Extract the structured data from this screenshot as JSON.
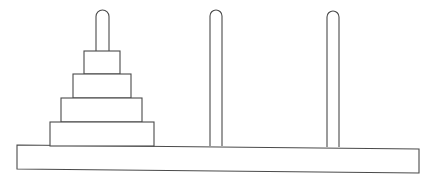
{
  "diagram": {
    "type": "tower-of-hanoi",
    "colors": {
      "stroke": "#4a4a4a",
      "fill": "#ffffff",
      "background": "#ffffff"
    },
    "base": {
      "points": "17,145 419,149 419,173 17,169"
    },
    "pegs": [
      {
        "id": "peg-left",
        "x": 96,
        "width": 13,
        "top": 10,
        "bottom": 51
      },
      {
        "id": "peg-middle",
        "x": 210,
        "width": 12,
        "top": 10,
        "bottom": 146
      },
      {
        "id": "peg-right",
        "x": 327,
        "width": 12,
        "top": 11,
        "bottom": 147
      }
    ],
    "disks": [
      {
        "id": "disk-1",
        "x": 84,
        "y": 51,
        "width": 36,
        "height": 23
      },
      {
        "id": "disk-2",
        "x": 73,
        "y": 74,
        "width": 58,
        "height": 24
      },
      {
        "id": "disk-3",
        "x": 61,
        "y": 98,
        "width": 81,
        "height": 24
      },
      {
        "id": "disk-4",
        "x": 50,
        "y": 122,
        "width": 104,
        "height": 24
      }
    ],
    "disk_count": 4,
    "peg_count": 3
  }
}
